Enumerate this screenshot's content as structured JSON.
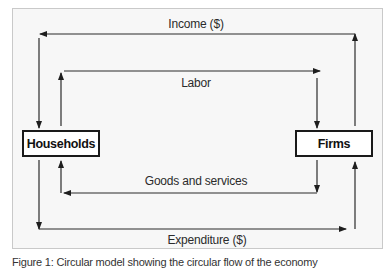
{
  "diagram": {
    "nodes": {
      "households": {
        "label": "Households"
      },
      "firms": {
        "label": "Firms"
      }
    },
    "flows": [
      {
        "id": "income",
        "label": "Income ($)",
        "from": "firms",
        "to": "households"
      },
      {
        "id": "labor",
        "label": "Labor",
        "from": "households",
        "to": "firms"
      },
      {
        "id": "goods",
        "label": "Goods and services",
        "from": "firms",
        "to": "households"
      },
      {
        "id": "expenditure",
        "label": "Expenditure ($)",
        "from": "households",
        "to": "firms"
      }
    ],
    "caption": "Figure 1: Circular model showing the circular flow of the economy"
  },
  "colors": {
    "line": "#2a2a2a",
    "frame_bg": "#f7f7f7",
    "frame_border": "#c9c9c9",
    "box_border": "#1a1a1a"
  }
}
